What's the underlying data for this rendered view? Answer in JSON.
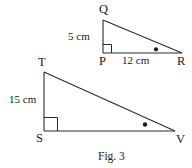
{
  "figure": {
    "caption": "Fig. 3",
    "stroke_color": "#2b2b2b",
    "text_color": "#1a1a1a",
    "background_color": "#ffffff",
    "triangles": [
      {
        "name": "triangle-pqr",
        "vertices": [
          {
            "label": "Q",
            "x": 103,
            "y": 20
          },
          {
            "label": "P",
            "x": 103,
            "y": 53
          },
          {
            "label": "R",
            "x": 182,
            "y": 53
          }
        ],
        "right_angle_at": "P",
        "marked_angle_at": "R",
        "sides": [
          {
            "name": "PQ",
            "measure": "5 cm"
          },
          {
            "name": "PR",
            "measure": "12 cm"
          }
        ]
      },
      {
        "name": "triangle-stv",
        "vertices": [
          {
            "label": "T",
            "x": 44,
            "y": 72
          },
          {
            "label": "S",
            "x": 44,
            "y": 131
          },
          {
            "label": "V",
            "x": 175,
            "y": 131
          }
        ],
        "right_angle_at": "S",
        "marked_angle_at": "V",
        "sides": [
          {
            "name": "TS",
            "measure": "15 cm"
          }
        ]
      }
    ],
    "labels": {
      "q": "Q",
      "p": "P",
      "r": "R",
      "t": "T",
      "s": "S",
      "v": "V",
      "pq_measure": "5 cm",
      "pr_measure": "12 cm",
      "ts_measure": "15 cm"
    }
  }
}
